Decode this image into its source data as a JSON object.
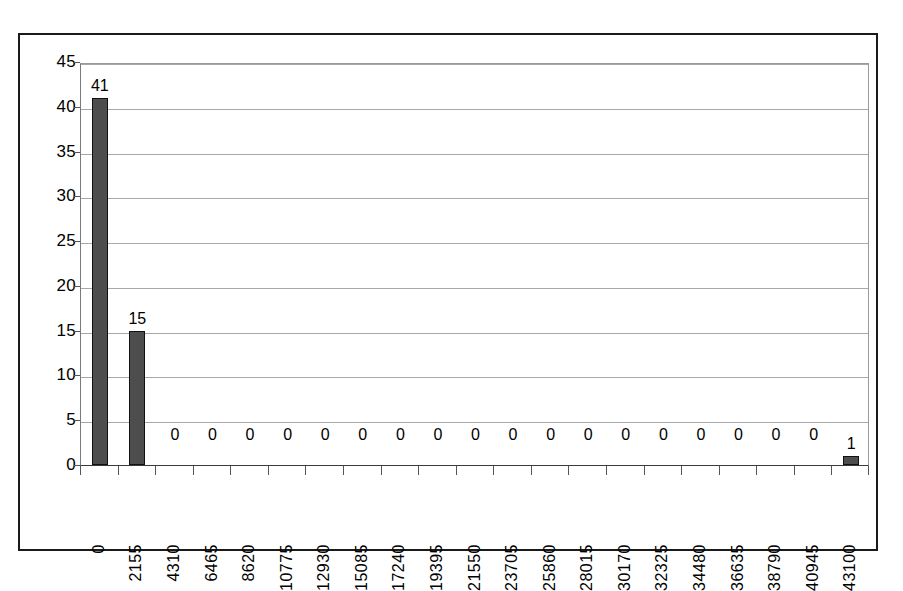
{
  "chart_data": {
    "type": "bar",
    "title": "",
    "subtitle": "",
    "xlabel": "",
    "ylabel": "",
    "categories": [
      "0",
      "2155",
      "4310",
      "6465",
      "8620",
      "10775",
      "12930",
      "15085",
      "17240",
      "19395",
      "21550",
      "23705",
      "25860",
      "28015",
      "30170",
      "32325",
      "34480",
      "36635",
      "38790",
      "40945",
      "43100"
    ],
    "values": [
      41,
      15,
      0,
      0,
      0,
      0,
      0,
      0,
      0,
      0,
      0,
      0,
      0,
      0,
      0,
      0,
      0,
      0,
      0,
      0,
      1
    ],
    "data_labels": [
      "41",
      "15",
      "0",
      "0",
      "0",
      "0",
      "0",
      "0",
      "0",
      "0",
      "0",
      "0",
      "0",
      "0",
      "0",
      "0",
      "0",
      "0",
      "0",
      "0",
      "1"
    ],
    "ylim": [
      0,
      45
    ],
    "y_ticks": [
      0,
      5,
      10,
      15,
      20,
      25,
      30,
      35,
      40,
      45
    ],
    "y_tick_labels": [
      "0",
      "5",
      "10",
      "15",
      "20",
      "25",
      "30",
      "35",
      "40",
      "45"
    ],
    "grid": "horizontal",
    "legend": "none",
    "series_name": "Frequency",
    "bar_color": "#4d4d4d",
    "bar_border_color": "#111111",
    "gridline_color": "#a8a8a8",
    "frame_color": "#1a1a1a",
    "background": "#ffffff",
    "x_label_rotation": -90
  }
}
